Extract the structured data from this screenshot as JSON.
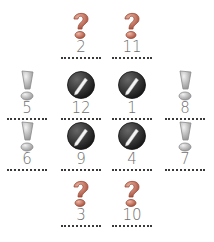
{
  "cards": [
    {
      "icon": "question-icon",
      "number": "2",
      "row": 0,
      "col": 1
    },
    {
      "icon": "question-icon",
      "number": "11",
      "row": 0,
      "col": 2
    },
    {
      "icon": "exclamation-icon",
      "number": "5",
      "row": 1,
      "col": 0
    },
    {
      "icon": "pencil-icon",
      "number": "12",
      "row": 1,
      "col": 1
    },
    {
      "icon": "pencil-icon",
      "number": "1",
      "row": 1,
      "col": 2
    },
    {
      "icon": "exclamation-icon",
      "number": "8",
      "row": 1,
      "col": 3
    },
    {
      "icon": "exclamation-icon",
      "number": "6",
      "row": 2,
      "col": 0
    },
    {
      "icon": "pencil-icon",
      "number": "9",
      "row": 2,
      "col": 1
    },
    {
      "icon": "pencil-icon",
      "number": "4",
      "row": 2,
      "col": 2
    },
    {
      "icon": "exclamation-icon",
      "number": "7",
      "row": 2,
      "col": 3
    },
    {
      "icon": "question-icon",
      "number": "3",
      "row": 3,
      "col": 1
    },
    {
      "icon": "question-icon",
      "number": "10",
      "row": 3,
      "col": 2
    }
  ],
  "colors": {
    "question": "#c9705a",
    "exclamation": "#c8c8c8",
    "pencil_disc": "#2f2f2f",
    "number": "#707070",
    "dotted_line": "#3a3a3a"
  }
}
